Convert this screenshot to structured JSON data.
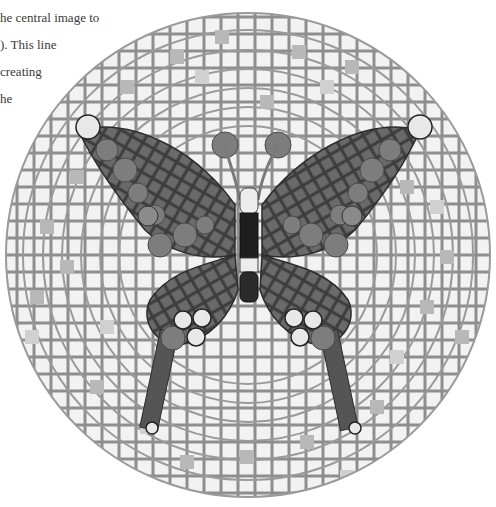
{
  "caption": {
    "lines": [
      "he central image to",
      "). This line",
      "creating",
      "he"
    ]
  },
  "image": {
    "subject": "butterfly-mosaic",
    "description": "Circular grayscale mosaic plate with concentric rings of square tiles and a central butterfly made of dark square tesserae, round disc accents and a segmented body",
    "colors": {
      "background": "#ffffff",
      "tile_light": "#f1f1f1",
      "tile_mid": "#c4c4c4",
      "tile_dark": "#9a9a9a",
      "grout": "#8a8a8a",
      "wing_dark": "#5c5c5c",
      "wing_mid": "#727272",
      "disc": "#7d7d7d",
      "disc_light": "#e8e8e8",
      "body_dark": "#1e1e1e"
    }
  }
}
